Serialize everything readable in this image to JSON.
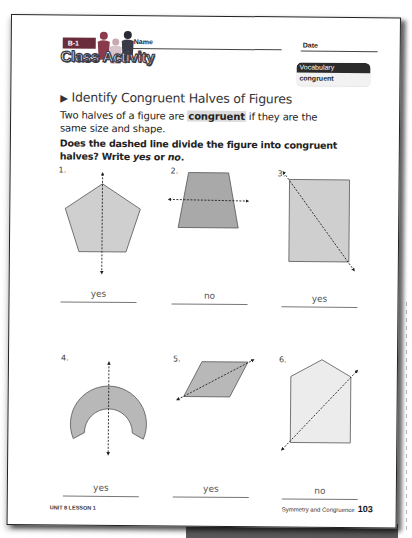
{
  "header": {
    "lesson_badge": "B-1",
    "activity_label": "Class Activity",
    "name_label": "Name",
    "date_label": "Date"
  },
  "vocabulary": {
    "heading": "Vocabulary",
    "words": [
      "congruent"
    ]
  },
  "title": "Identify Congruent Halves of Figures",
  "intro": {
    "before": "Two halves of a figure are ",
    "highlight": "congruent",
    "after": " if they are the same size and shape."
  },
  "question": {
    "text": "Does the dashed line divide the figure into congruent halves? Write ",
    "opt1": "yes",
    "mid": " or ",
    "opt2": "no",
    "end": "."
  },
  "problems": [
    {
      "number": "1.",
      "shape": "pentagon",
      "line": "vertical",
      "answer": "yes"
    },
    {
      "number": "2.",
      "shape": "trapezoid",
      "line": "horizontal",
      "answer": "no"
    },
    {
      "number": "3.",
      "shape": "rectangle",
      "line": "diagonal",
      "answer": "yes"
    },
    {
      "number": "4.",
      "shape": "horseshoe",
      "line": "vertical",
      "answer": "yes"
    },
    {
      "number": "5.",
      "shape": "parallelogram",
      "line": "diagonal",
      "answer": "yes"
    },
    {
      "number": "6.",
      "shape": "house-pentagon",
      "line": "diagonal",
      "answer": "no"
    }
  ],
  "footer": {
    "left": "UNIT 8 LESSON 1",
    "right_text": "Symmetry and Congruence",
    "page_number": "103"
  },
  "colors": {
    "badge": "#6a2b3a",
    "shape_fill_light": "#cfcfcf",
    "shape_fill_dark": "#a9a9a9",
    "shape_fill_pale": "#ececec"
  }
}
